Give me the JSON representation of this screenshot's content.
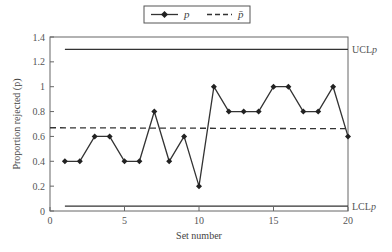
{
  "chart_data": {
    "type": "line",
    "title": "",
    "xlabel": "Set number",
    "ylabel": "Proportion rejected (p)",
    "xlim": [
      0,
      20
    ],
    "ylim": [
      0,
      1.4
    ],
    "x_ticks": [
      "0",
      "5",
      "10",
      "15",
      "20"
    ],
    "y_ticks": [
      "0",
      "0.2",
      "0.4",
      "0.6",
      "0.8",
      "1",
      "1.2",
      "1.4"
    ],
    "grid": false,
    "legend_position": "top-center",
    "legend": [
      "p",
      "p̄"
    ],
    "x": [
      1,
      2,
      3,
      4,
      5,
      6,
      7,
      8,
      9,
      10,
      11,
      12,
      13,
      14,
      15,
      16,
      17,
      18,
      19,
      20
    ],
    "series": [
      {
        "name": "p",
        "style": "solid-diamond-markers",
        "values": [
          0.4,
          0.4,
          0.6,
          0.6,
          0.4,
          0.4,
          0.8,
          0.4,
          0.6,
          0.2,
          1.0,
          0.8,
          0.8,
          0.8,
          1.0,
          1.0,
          0.8,
          0.8,
          1.0,
          0.6
        ]
      },
      {
        "name": "p̄",
        "style": "dashed",
        "value": 0.67
      }
    ],
    "control_limits": {
      "UCL": {
        "label": "UCL",
        "subscript": "p",
        "value": 1.3
      },
      "LCL": {
        "label": "LCL",
        "subscript": "p",
        "value": 0.04
      }
    }
  },
  "colors": {
    "line": "#333333",
    "axis": "#555555"
  }
}
